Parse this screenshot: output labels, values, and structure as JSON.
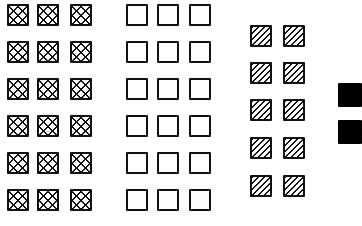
{
  "diagram": {
    "title": "",
    "groups": [
      {
        "name": "cross-hatched-squares",
        "pattern": "cross-hatch",
        "columns": 3,
        "rows": 6,
        "count": 18,
        "xs": [
          7,
          37,
          70
        ],
        "ys": [
          4,
          41,
          78,
          115,
          152,
          189
        ]
      },
      {
        "name": "empty-squares",
        "pattern": "empty",
        "columns": 3,
        "rows": 6,
        "count": 18,
        "xs": [
          126,
          157,
          189
        ],
        "ys": [
          4,
          41,
          78,
          115,
          152,
          189
        ]
      },
      {
        "name": "diagonal-hatched-squares",
        "pattern": "diagonal-hatch",
        "columns": 2,
        "rows": 5,
        "count": 10,
        "xs": [
          250,
          283
        ],
        "ys": [
          25,
          62,
          99,
          137,
          175
        ]
      },
      {
        "name": "solid-black-squares",
        "pattern": "solid",
        "columns": 1,
        "rows": 2,
        "count": 2,
        "xs": [
          338
        ],
        "ys": [
          83,
          120
        ]
      }
    ],
    "colors": {
      "stroke": "#111111",
      "fill_solid": "#000000",
      "background": "#ffffff"
    }
  }
}
